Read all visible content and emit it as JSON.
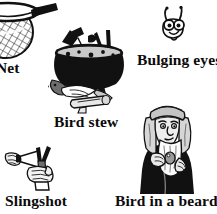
{
  "page": {
    "background_color": "#ffffff",
    "width": 217,
    "height": 214,
    "ink_color": "#111111"
  },
  "illustrations": [
    {
      "id": "net",
      "caption": "Net",
      "icon_name": "fishing-net-illustration",
      "description": "A fishing net with a mesh bag and a handle, cropped by the left edge of the page",
      "cropped": true
    },
    {
      "id": "bird-stew",
      "caption": "Bird stew",
      "icon_name": "cauldron-illustration",
      "description": "A black cauldron full of birds and utensils with birds and a log beneath it",
      "cropped": false
    },
    {
      "id": "bulging-eyes",
      "caption": "Bulging eyes",
      "icon_name": "bulging-eyes-creature-illustration",
      "description": "A small creature head with two antennae and two large round bulging eyes",
      "cropped": false
    },
    {
      "id": "slingshot",
      "caption": "Slingshot",
      "icon_name": "slingshot-illustration",
      "description": "Two hands holding a Y-shaped slingshot with the band pulled back",
      "cropped": false
    },
    {
      "id": "bird-in-a-beard",
      "caption": "Bird in a beard",
      "icon_name": "bearded-man-illustration",
      "description": "A man wearing a headdress with a long beard concealing a bird",
      "cropped": false
    }
  ]
}
